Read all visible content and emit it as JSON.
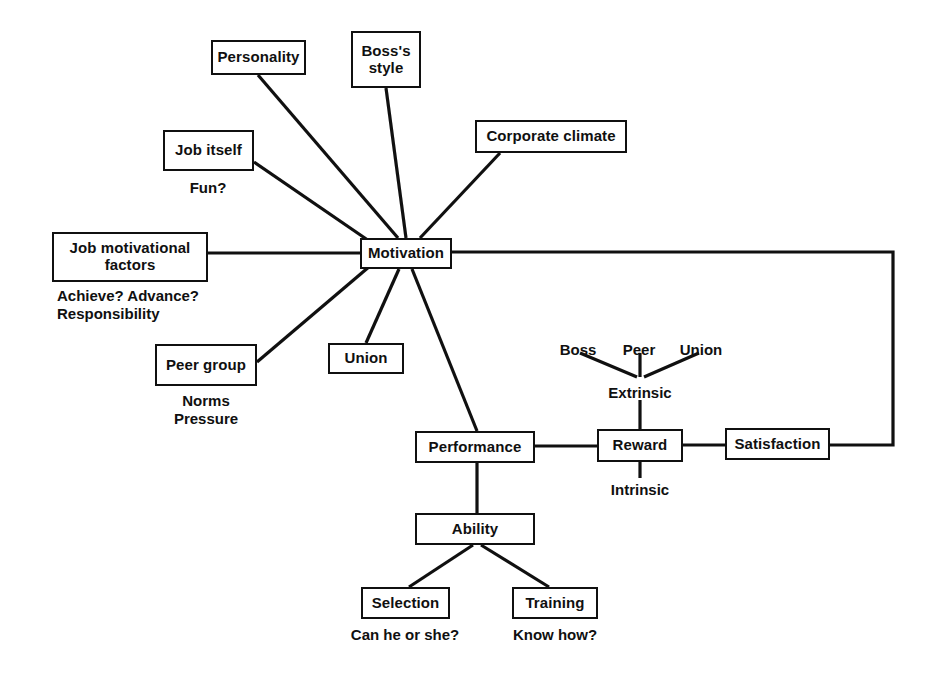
{
  "diagram": {
    "type": "node-link concept diagram",
    "stroke_color": "#101010",
    "background_color": "#ffffff",
    "nodes": [
      {
        "id": "personality",
        "label": "Personality",
        "x": 211,
        "y": 40,
        "w": 95,
        "h": 35
      },
      {
        "id": "bosss_style",
        "label": "Boss's\nstyle",
        "x": 351,
        "y": 31,
        "w": 70,
        "h": 57
      },
      {
        "id": "corporate_climate",
        "label": "Corporate climate",
        "x": 475,
        "y": 120,
        "w": 152,
        "h": 33
      },
      {
        "id": "job_itself",
        "label": "Job itself",
        "x": 163,
        "y": 130,
        "w": 91,
        "h": 41
      },
      {
        "id": "job_motivational",
        "label": "Job motivational\nfactors",
        "x": 52,
        "y": 232,
        "w": 156,
        "h": 50
      },
      {
        "id": "motivation",
        "label": "Motivation",
        "x": 360,
        "y": 238,
        "w": 92,
        "h": 31
      },
      {
        "id": "peer_group",
        "label": "Peer group",
        "x": 155,
        "y": 344,
        "w": 102,
        "h": 42
      },
      {
        "id": "union",
        "label": "Union",
        "x": 328,
        "y": 343,
        "w": 76,
        "h": 31
      },
      {
        "id": "performance",
        "label": "Performance",
        "x": 415,
        "y": 431,
        "w": 120,
        "h": 32
      },
      {
        "id": "reward",
        "label": "Reward",
        "x": 597,
        "y": 429,
        "w": 86,
        "h": 33
      },
      {
        "id": "satisfaction",
        "label": "Satisfaction",
        "x": 725,
        "y": 428,
        "w": 105,
        "h": 32
      },
      {
        "id": "ability",
        "label": "Ability",
        "x": 415,
        "y": 513,
        "w": 120,
        "h": 32
      },
      {
        "id": "selection",
        "label": "Selection",
        "x": 361,
        "y": 587,
        "w": 89,
        "h": 32
      },
      {
        "id": "training",
        "label": "Training",
        "x": 512,
        "y": 587,
        "w": 86,
        "h": 32
      }
    ],
    "annotations": [
      {
        "id": "fun",
        "text": "Fun?",
        "x": 208,
        "y": 179,
        "align": "center"
      },
      {
        "id": "achieve_advance",
        "text": "Achieve? Advance?\nResponsibility",
        "x": 57,
        "y": 287,
        "align": "left"
      },
      {
        "id": "norms_pressure",
        "text": "Norms\nPressure",
        "x": 206,
        "y": 392,
        "align": "center"
      },
      {
        "id": "boss",
        "text": "Boss",
        "x": 578,
        "y": 341,
        "align": "center"
      },
      {
        "id": "peer",
        "text": "Peer",
        "x": 639,
        "y": 341,
        "align": "center"
      },
      {
        "id": "union_label",
        "text": "Union",
        "x": 701,
        "y": 341,
        "align": "center"
      },
      {
        "id": "extrinsic",
        "text": "Extrinsic",
        "x": 640,
        "y": 384,
        "align": "center"
      },
      {
        "id": "intrinsic",
        "text": "Intrinsic",
        "x": 640,
        "y": 481,
        "align": "center"
      },
      {
        "id": "can_he_or_she",
        "text": "Can he or she?",
        "x": 405,
        "y": 626,
        "align": "center"
      },
      {
        "id": "know_how",
        "text": "Know how?",
        "x": 555,
        "y": 626,
        "align": "center"
      }
    ],
    "edges": [
      {
        "id": "personality-motivation",
        "from": "Personality",
        "to": "Motivation",
        "shape": "diagonal"
      },
      {
        "id": "bosss-style-motivation",
        "from": "Boss's style",
        "to": "Motivation",
        "shape": "diagonal"
      },
      {
        "id": "corporate-climate-motivation",
        "from": "Corporate climate",
        "to": "Motivation",
        "shape": "diagonal"
      },
      {
        "id": "job-itself-motivation",
        "from": "Job itself",
        "to": "Motivation",
        "shape": "diagonal"
      },
      {
        "id": "job-factors-motivation",
        "from": "Job motivational factors",
        "to": "Motivation",
        "shape": "horizontal"
      },
      {
        "id": "peer-group-motivation",
        "from": "Peer group",
        "to": "Motivation",
        "shape": "diagonal"
      },
      {
        "id": "motivation-union",
        "from": "Motivation",
        "to": "Union",
        "shape": "diagonal"
      },
      {
        "id": "motivation-performance",
        "from": "Motivation",
        "to": "Performance",
        "shape": "diagonal"
      },
      {
        "id": "performance-reward",
        "from": "Performance",
        "to": "Reward",
        "shape": "horizontal"
      },
      {
        "id": "reward-satisfaction",
        "from": "Reward",
        "to": "Satisfaction",
        "shape": "horizontal"
      },
      {
        "id": "satisfaction-motivation",
        "from": "Satisfaction",
        "to": "Motivation",
        "shape": "feedback-loop"
      },
      {
        "id": "performance-ability",
        "from": "Performance",
        "to": "Ability",
        "shape": "vertical"
      },
      {
        "id": "ability-selection",
        "from": "Ability",
        "to": "Selection",
        "shape": "diagonal"
      },
      {
        "id": "ability-training",
        "from": "Ability",
        "to": "Training",
        "shape": "diagonal"
      },
      {
        "id": "boss-extrinsic",
        "from": "Boss",
        "to": "Extrinsic",
        "shape": "diagonal"
      },
      {
        "id": "peer-extrinsic",
        "from": "Peer",
        "to": "Extrinsic",
        "shape": "vertical"
      },
      {
        "id": "union-extrinsic",
        "from": "Union",
        "to": "Extrinsic",
        "shape": "diagonal"
      },
      {
        "id": "extrinsic-reward",
        "from": "Extrinsic",
        "to": "Reward",
        "shape": "vertical"
      },
      {
        "id": "reward-intrinsic",
        "from": "Reward",
        "to": "Intrinsic",
        "shape": "vertical"
      }
    ]
  }
}
